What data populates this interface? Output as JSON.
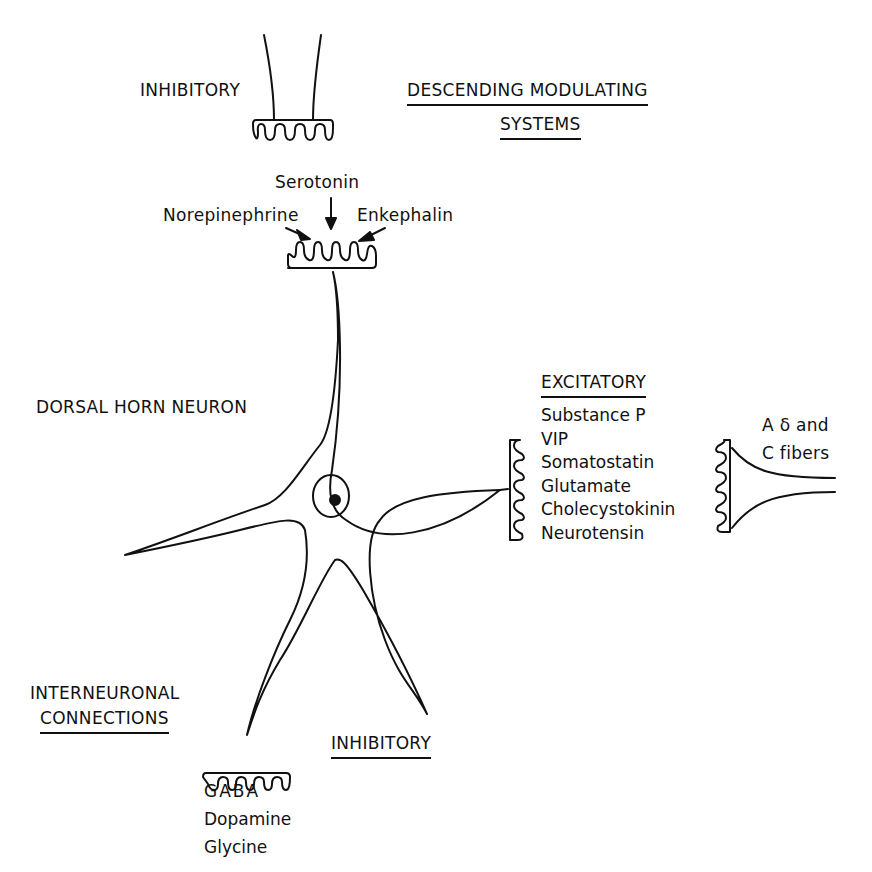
{
  "diagram": {
    "neuron_label": "DORSAL HORN NEURON",
    "top": {
      "inhibitory_label": "INHIBITORY",
      "system_label_line1": "DESCENDING MODULATING",
      "system_label_line2": "SYSTEMS",
      "neurotransmitters": {
        "top": "Serotonin",
        "left": "Norepinephrine",
        "right": "Enkephalin"
      }
    },
    "right": {
      "excitatory_label": "EXCITATORY",
      "neurotransmitters": [
        "Substance P",
        "VIP",
        "Somatostatin",
        "Glutamate",
        "Cholecystokinin",
        "Neurotensin"
      ],
      "fibers_line1": "A δ and",
      "fibers_line2": "C fibers"
    },
    "bottom": {
      "interneuronal_line1": "INTERNEURONAL",
      "interneuronal_line2": "CONNECTIONS",
      "inhibitory_label": "INHIBITORY",
      "neurotransmitters": [
        "GABA",
        "Dopamine",
        "Glycine"
      ]
    },
    "colors": {
      "line": "#111111",
      "background": "#ffffff"
    }
  }
}
